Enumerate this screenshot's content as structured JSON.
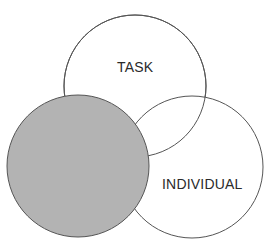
{
  "diagram": {
    "type": "venn",
    "circles": [
      {
        "id": "task",
        "label": "TASK",
        "cx": 135,
        "cy": 86,
        "r": 71,
        "fill": "#ffffff",
        "stroke": "#555555"
      },
      {
        "id": "individual",
        "label": "INDIVIDUAL",
        "cx": 192,
        "cy": 167,
        "r": 71,
        "fill": "#ffffff",
        "stroke": "#555555"
      },
      {
        "id": "shaded",
        "label": "",
        "cx": 78,
        "cy": 166,
        "r": 71,
        "fill": "#b3b3b3",
        "stroke": "#555555"
      }
    ],
    "labels": {
      "task": "TASK",
      "individual": "INDIVIDUAL"
    }
  }
}
